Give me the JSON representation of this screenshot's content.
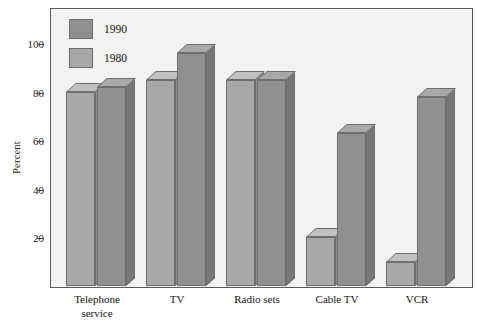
{
  "chart_data": {
    "type": "bar",
    "title": "",
    "subtitle": "",
    "xlabel": "",
    "ylabel": "Percent",
    "categories": [
      "Telephone service",
      "TV",
      "Radio sets",
      "Cable TV",
      "VCR"
    ],
    "series": [
      {
        "name": "1980",
        "values": [
          80,
          85,
          85,
          20,
          10
        ],
        "color": "#a9a8a6"
      },
      {
        "name": "1990",
        "values": [
          82,
          96,
          85,
          63,
          78
        ],
        "color": "#909090"
      }
    ],
    "ylim": [
      0,
      110
    ],
    "yticks": [
      20,
      40,
      60,
      80,
      100
    ],
    "ytick_labels": [
      "20",
      "40",
      "60",
      "80",
      "100"
    ],
    "grid": false,
    "legend_position": "top-left",
    "legend_entries": [
      "1990",
      "1980"
    ],
    "style": "3d-bars",
    "colors": {
      "plot_background": "#f3f2f0",
      "frame": "#5a5a58",
      "bar_1980_face": "#a9a8a6",
      "bar_1980_top": "#c2c1bf",
      "bar_1980_side": "#8e8d8b",
      "bar_1990_face": "#909090",
      "bar_1990_top": "#aaa9a7",
      "bar_1990_side": "#767674",
      "text": "#141414"
    }
  }
}
